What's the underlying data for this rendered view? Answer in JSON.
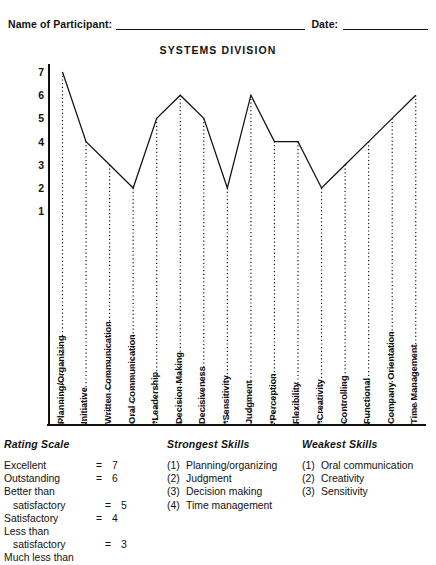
{
  "header": {
    "participant_label": "Name of Participant:",
    "date_label": "Date:",
    "title": "SYSTEMS DIVISION"
  },
  "chart_data": {
    "type": "line",
    "title": "SYSTEMS DIVISION",
    "xlabel": "",
    "ylabel": "",
    "ylim": [
      0,
      7
    ],
    "yticks": [
      7,
      6,
      5,
      4,
      3,
      2,
      1
    ],
    "grid": false,
    "legend": "none",
    "marker_style": "dotted-drop-lines",
    "categories": [
      "Planning/Organizing",
      "Initiative",
      "Written Communication",
      "Oral Communication",
      "*Leadership",
      "Decision Making",
      "Decisiveness",
      "*Sensitivity",
      "Judgment",
      "*Perception",
      "Flexibility",
      "*Creativity",
      "Controlling",
      "Functional",
      "Company Orientation",
      "Time Management"
    ],
    "values": [
      7,
      4,
      3,
      2,
      5,
      6,
      5,
      2,
      6,
      4,
      4,
      2,
      3,
      4,
      5,
      6
    ]
  },
  "rating_scale": {
    "heading": "Rating Scale",
    "rows": [
      {
        "name": "Excellent",
        "indent": false,
        "eq": "=",
        "value": "7"
      },
      {
        "name": "Outstanding",
        "indent": false,
        "eq": "=",
        "value": "6"
      },
      {
        "name": "Better than",
        "indent": false,
        "eq": "",
        "value": ""
      },
      {
        "name": "satisfactory",
        "indent": true,
        "eq": "=",
        "value": "5"
      },
      {
        "name": "Satisfactory",
        "indent": false,
        "eq": "=",
        "value": "4"
      },
      {
        "name": "Less than",
        "indent": false,
        "eq": "",
        "value": ""
      },
      {
        "name": "satisfactory",
        "indent": true,
        "eq": "=",
        "value": "3"
      },
      {
        "name": "Much less than",
        "indent": false,
        "eq": "",
        "value": ""
      }
    ]
  },
  "strongest_skills": {
    "heading": "Strongest Skills",
    "items": [
      {
        "num": "(1)",
        "label": "Planning/organizing"
      },
      {
        "num": "(2)",
        "label": "Judgment"
      },
      {
        "num": "(3)",
        "label": "Decision making"
      },
      {
        "num": "(4)",
        "label": "Time management"
      }
    ]
  },
  "weakest_skills": {
    "heading": "Weakest Skills",
    "items": [
      {
        "num": "(1)",
        "label": "Oral communication"
      },
      {
        "num": "(2)",
        "label": "Creativity"
      },
      {
        "num": "(3)",
        "label": "Sensitivity"
      }
    ]
  }
}
